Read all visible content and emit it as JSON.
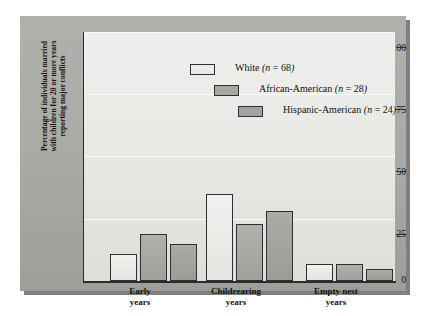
{
  "chart_data": {
    "type": "bar",
    "title": "",
    "xlabel": "",
    "ylabel": "Percentage of individuals married with children for 20 or more years reporting major conflicts",
    "ylabel_lines": [
      "Percentage of individuals married",
      "with children for 20 or more years",
      "reporting major conflicts"
    ],
    "ylim": [
      0,
      100
    ],
    "yticks": [
      0,
      25,
      50,
      75,
      100
    ],
    "ytick_labels": [
      "0",
      "25",
      "50",
      "75",
      "100"
    ],
    "grid": true,
    "grid_axis": "y",
    "legend_position": "upper-center",
    "categories": [
      "Early years",
      "Childrearing years",
      "Empty nest years"
    ],
    "category_lines": [
      [
        "Early",
        "years"
      ],
      [
        "Childrearing",
        "years"
      ],
      [
        "Empty nest",
        "years"
      ]
    ],
    "series": [
      {
        "name": "White",
        "n": 68,
        "legend_label": "White (n = 68)",
        "color": "#eaeae7",
        "values": [
          11,
          35,
          7
        ]
      },
      {
        "name": "African-American",
        "n": 28,
        "legend_label": "African-American (n = 28)",
        "color": "#a7a7a4",
        "values": [
          19,
          23,
          7
        ]
      },
      {
        "name": "Hispanic-American",
        "n": 24,
        "legend_label": "Hispanic-American (n = 24)",
        "color": "#a2a29f",
        "values": [
          15,
          28,
          5
        ]
      }
    ]
  },
  "legend": {
    "rows": [
      {
        "label_main": "White",
        "label_n": "(n = 68)",
        "swatch": "white"
      },
      {
        "label_main": "African-American",
        "label_n": "(n = 28)",
        "swatch": "aa"
      },
      {
        "label_main": "Hispanic-American",
        "label_n": "(n = 24)",
        "swatch": "ha"
      }
    ]
  },
  "colors": {
    "panel": "#a9a9a6",
    "plot_background": "#e6e6e3",
    "axis": "#2b2b2b",
    "gridline": "#fbfbfa",
    "series_white": "#eaeae7",
    "series_african_american": "#a7a7a4",
    "series_hispanic_american": "#a2a29f"
  }
}
